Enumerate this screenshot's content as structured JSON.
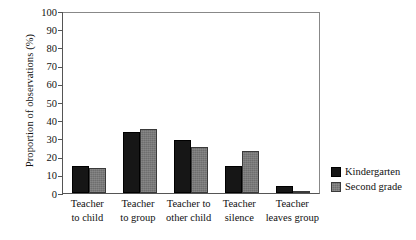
{
  "chart_data": {
    "type": "bar",
    "title": "",
    "xlabel": "",
    "ylabel": "Proportion of observations (%)",
    "ylim": [
      0,
      100
    ],
    "yticks": [
      0,
      10,
      20,
      30,
      40,
      50,
      60,
      70,
      80,
      90,
      100
    ],
    "grid": false,
    "legend_position": "right",
    "categories": [
      "Teacher to child",
      "Teacher to group",
      "Teacher to other child",
      "Teacher silence",
      "Teacher leaves group"
    ],
    "category_lines": [
      [
        "Teacher",
        "to child"
      ],
      [
        "Teacher",
        "to group"
      ],
      [
        "Teacher to",
        "other child"
      ],
      [
        "Teacher",
        "silence"
      ],
      [
        "Teacher",
        "leaves group"
      ]
    ],
    "series": [
      {
        "name": "Kindergarten",
        "color": "#161616",
        "values": [
          15,
          33.5,
          29,
          15,
          4
        ]
      },
      {
        "name": "Second grade",
        "color": "#6e6e6e",
        "values": [
          13.5,
          35,
          25.5,
          23,
          1
        ]
      }
    ]
  },
  "legend": {
    "items": [
      {
        "label": "Kindergarten"
      },
      {
        "label": "Second grade"
      }
    ]
  }
}
